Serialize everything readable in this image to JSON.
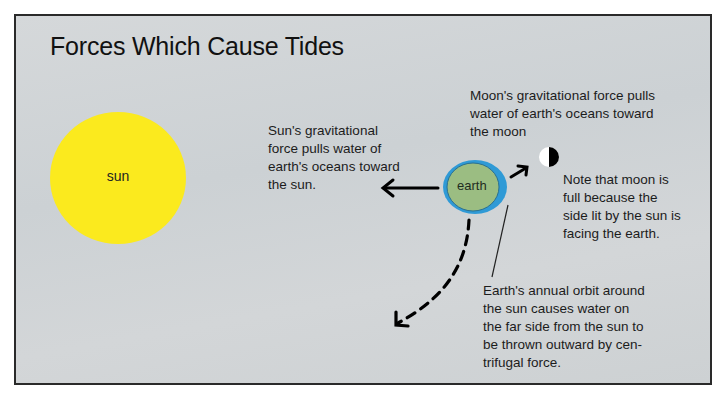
{
  "diagram": {
    "title": "Forces Which Cause Tides",
    "bodies": {
      "sun": {
        "label": "sun",
        "color": "#fbea1e"
      },
      "earth": {
        "label": "earth",
        "land_color": "#9bbd82",
        "ocean_color": "#2f9ad6"
      },
      "moon": {
        "label": "",
        "lit_color": "#ffffff",
        "dark_color": "#000000"
      }
    },
    "annotations": {
      "sun_force": [
        "Sun's gravitational",
        "force pulls water of",
        "earth's oceans toward",
        "the sun."
      ],
      "moon_force": [
        "Moon's gravitational force pulls",
        "water of earth's oceans toward",
        "the moon"
      ],
      "moon_note": [
        "Note that moon is",
        "full because the",
        "side lit by the sun is",
        "facing the earth."
      ],
      "orbit_note": [
        "Earth's annual orbit around",
        "the sun causes water on",
        "the far side from the sun to",
        "be thrown outward by cen-",
        "trifugal force."
      ]
    },
    "arrows": [
      {
        "name": "toward-sun",
        "style": "solid",
        "direction": "left"
      },
      {
        "name": "toward-moon",
        "style": "solid",
        "direction": "up-right"
      },
      {
        "name": "centrifugal",
        "style": "dashed",
        "direction": "down-left"
      }
    ]
  }
}
